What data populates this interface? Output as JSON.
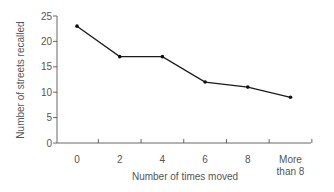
{
  "chart_data": {
    "type": "line",
    "title": "",
    "xlabel": "Number of times moved",
    "ylabel": "Number of streets recalled",
    "categories": [
      "0",
      "2",
      "4",
      "6",
      "8",
      "More than 8"
    ],
    "category_lines": [
      [
        "0"
      ],
      [
        "2"
      ],
      [
        "4"
      ],
      [
        "6"
      ],
      [
        "8"
      ],
      [
        "More",
        "than 8"
      ]
    ],
    "series": [
      {
        "name": "Streets recalled",
        "values": [
          23,
          17,
          17,
          12,
          11,
          9
        ]
      }
    ],
    "ylim": [
      0,
      25
    ],
    "yticks": [
      0,
      5,
      10,
      15,
      20,
      25
    ],
    "grid": false,
    "legend": "none"
  }
}
